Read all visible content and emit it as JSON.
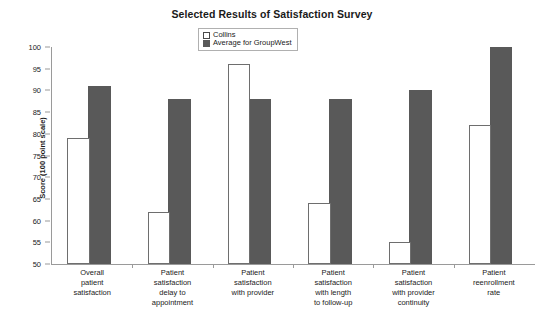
{
  "chart_data": {
    "type": "bar",
    "title": "Selected Results of Satisfaction Survey",
    "xlabel": "",
    "ylabel": "Score (100 point scale)",
    "ylim": [
      50,
      100
    ],
    "ytick_step": 5,
    "ytick_labels": [
      "100",
      "95",
      "90",
      "85",
      "80",
      "75",
      "70",
      "65",
      "60",
      "55",
      "50"
    ],
    "grid": false,
    "legend_position": "top-center",
    "categories": [
      "Overall patient satisfaction",
      "Patient satisfaction delay to appointment",
      "Patient satisfaction with provider",
      "Patient satisfaction with length to follow-up",
      "Patient satisfaction with provider continuity",
      "Patient reenrollment rate"
    ],
    "category_label_lines": [
      [
        "Overall",
        "patient",
        "satisfaction"
      ],
      [
        "Patient",
        "satisfaction",
        "delay to",
        "appointment"
      ],
      [
        "Patient",
        "satisfaction",
        "with provider"
      ],
      [
        "Patient",
        "satisfaction",
        "with length",
        "to follow-up"
      ],
      [
        "Patient",
        "satisfaction",
        "with provider",
        "continuity"
      ],
      [
        "Patient",
        "reenrollment",
        "rate"
      ]
    ],
    "series": [
      {
        "name": "Collins",
        "color": "#ffffff",
        "border_color": "#6e6e6e",
        "values": [
          79,
          62,
          96,
          64,
          55,
          82
        ]
      },
      {
        "name": "Average for GroupWest",
        "color": "#595959",
        "border_color": "#595959",
        "values": [
          91,
          88,
          88,
          88,
          90,
          100
        ]
      }
    ]
  }
}
